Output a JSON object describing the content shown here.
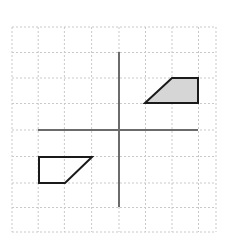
{
  "figure": {
    "background_color": "#ffffff"
  },
  "grid": {
    "name": "coordinate-grid",
    "columns": 8,
    "rows": 8,
    "cell_size_px": 26.7,
    "left_px": 12,
    "top_px": 27,
    "right_px": 205.6,
    "bottom_px": 232,
    "line_color": "#c9c9c9",
    "line_style": "dashed",
    "line_width_px": 1
  },
  "axes": {
    "name": "coordinate-axes",
    "color": "#6b6b6b",
    "line_width_px": 2,
    "origin_px": {
      "x": 119,
      "y": 130
    },
    "x_axis": {
      "label": "",
      "x1": 38,
      "y1": 130,
      "x2": 198,
      "y2": 130
    },
    "y_axis": {
      "label": "",
      "x1": 119,
      "y1": 52,
      "x2": 119,
      "y2": 207
    }
  },
  "shapes": [
    {
      "name": "shaded-trapezoid",
      "quadrant": "I",
      "fill": "#d6d6d6",
      "stroke": "#1a1a1a",
      "stroke_width_px": 2,
      "filled": true,
      "points_px": "145,103 172,78 198,78 198,103",
      "vertices_grid": [
        [
          1,
          1
        ],
        [
          2,
          2
        ],
        [
          3,
          2
        ],
        [
          3,
          1
        ]
      ]
    },
    {
      "name": "unshaded-trapezoid",
      "quadrant": "III",
      "fill": "none",
      "stroke": "#1a1a1a",
      "stroke_width_px": 2,
      "filled": false,
      "points_px": "39,157 92,157 65,183 39,183",
      "vertices_grid": [
        [
          -3,
          -1
        ],
        [
          -1,
          -1
        ],
        [
          -2,
          -2
        ],
        [
          -3,
          -2
        ]
      ]
    }
  ]
}
